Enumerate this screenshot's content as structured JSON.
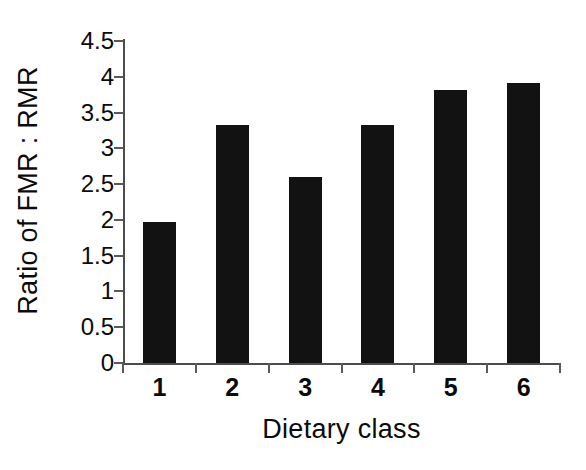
{
  "chart_data": {
    "type": "bar",
    "title": "",
    "subtitle": "",
    "xlabel": "Dietary class",
    "ylabel": "Ratio of FMR : RMR",
    "categories": [
      "1",
      "2",
      "3",
      "4",
      "5",
      "6"
    ],
    "values": [
      1.97,
      3.33,
      2.6,
      3.33,
      3.81,
      3.91
    ],
    "ylim": [
      0,
      4.5
    ],
    "yticks": [
      0,
      0.5,
      1,
      1.5,
      2,
      2.5,
      3,
      3.5,
      4,
      4.5
    ],
    "ytick_labels": [
      "0",
      "0.5",
      "1",
      "1.5",
      "2",
      "2.5",
      "3",
      "3.5",
      "4",
      "4.5"
    ],
    "grid": false,
    "legend": false,
    "legend_position": "none",
    "bar_color": "#121212",
    "axis_color": "#4d4d4d",
    "background_color": "#ffffff",
    "series": [
      {
        "name": "Ratio of FMR : RMR",
        "values": [
          1.97,
          3.33,
          2.6,
          3.33,
          3.81,
          3.91
        ]
      }
    ]
  }
}
